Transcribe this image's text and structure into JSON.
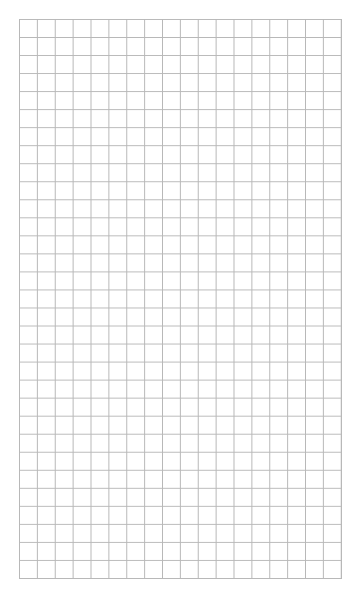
{
  "page": {
    "type": "graph-paper",
    "background_color": "#ffffff",
    "line_color": "#b8b8b8"
  },
  "grid": {
    "columns": 18,
    "rows": 31,
    "left": 19,
    "top": 19,
    "width": 323,
    "height": 560
  }
}
